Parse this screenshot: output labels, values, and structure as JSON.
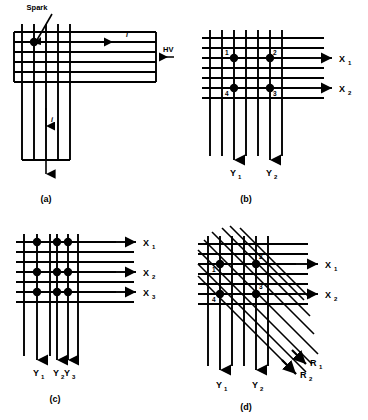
{
  "figure": {
    "type": "spark-chamber-wire-readout-schematic",
    "background": "#ffffff",
    "ink": "#000000",
    "panels": [
      {
        "id": "a",
        "caption": "(a)",
        "description": "Single spark in crossed wire grid with high voltage and current path",
        "labels": {
          "spark": "Spark",
          "hv": "HV",
          "current_horizontal": "i",
          "current_vertical": "i"
        },
        "grid": {
          "vertical_wires": 5,
          "horizontal_wires": 6
        },
        "spark_points": [
          {
            "label": "",
            "col": 1,
            "row": 1
          }
        ]
      },
      {
        "id": "b",
        "caption": "(b)",
        "description": "Four sparks producing ambiguous X and Y coordinate readout",
        "axis_labels": {
          "x": [
            "X",
            "X"
          ],
          "x_sub": [
            "1",
            "2"
          ],
          "y": [
            "Y",
            "Y"
          ],
          "y_sub": [
            "1",
            "2"
          ]
        },
        "grid": {
          "vertical_wires": 7,
          "horizontal_wires": 7
        },
        "spark_points": [
          {
            "label": "1",
            "col": 2,
            "row": 2
          },
          {
            "label": "2",
            "col": 5,
            "row": 2
          },
          {
            "label": "4",
            "col": 2,
            "row": 5
          },
          {
            "label": "3",
            "col": 5,
            "row": 5
          }
        ]
      },
      {
        "id": "c",
        "caption": "(c)",
        "description": "Nine sparks at intersections of three X and three Y readout wires",
        "axis_labels": {
          "x": [
            "X",
            "X",
            "X"
          ],
          "x_sub": [
            "1",
            "2",
            "3"
          ],
          "y": [
            "Y",
            "Y",
            "Y"
          ],
          "y_sub": [
            "1",
            "2",
            "3"
          ]
        },
        "grid": {
          "vertical_wires": 6,
          "horizontal_wires": 7
        },
        "spark_points": [
          {
            "label": "",
            "col": 1,
            "row": 1
          },
          {
            "label": "",
            "col": 3,
            "row": 1
          },
          {
            "label": "",
            "col": 4,
            "row": 1
          },
          {
            "label": "",
            "col": 1,
            "row": 3
          },
          {
            "label": "",
            "col": 3,
            "row": 3
          },
          {
            "label": "",
            "col": 4,
            "row": 3
          },
          {
            "label": "",
            "col": 1,
            "row": 5
          },
          {
            "label": "",
            "col": 3,
            "row": 5
          },
          {
            "label": "",
            "col": 4,
            "row": 5
          }
        ]
      },
      {
        "id": "d",
        "caption": "(d)",
        "description": "Four sparks resolved by adding a third set of diagonal R readout wires",
        "axis_labels": {
          "x": [
            "X",
            "X"
          ],
          "x_sub": [
            "1",
            "2"
          ],
          "y": [
            "Y",
            "Y"
          ],
          "y_sub": [
            "1",
            "2"
          ],
          "r": [
            "R",
            "R"
          ],
          "r_sub": [
            "1",
            "2"
          ]
        },
        "grid": {
          "vertical_wires": 6,
          "horizontal_wires": 7,
          "diagonal_wires": 8
        },
        "spark_points": [
          {
            "label": "1",
            "col": 1,
            "row": 2
          },
          {
            "label": "2",
            "col": 4,
            "row": 2
          },
          {
            "label": "4",
            "col": 1,
            "row": 4
          },
          {
            "label": "3",
            "col": 4,
            "row": 4
          }
        ]
      }
    ]
  }
}
